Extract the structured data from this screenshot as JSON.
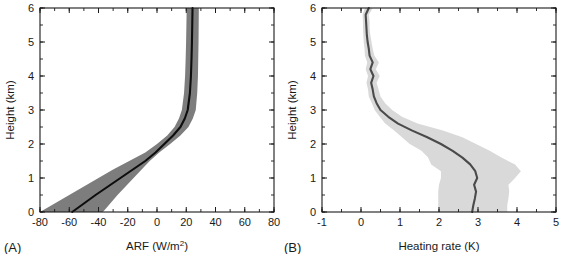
{
  "figure": {
    "background": "#ffffff",
    "width": 567,
    "height": 254
  },
  "panels": {
    "a": {
      "label": "(A)",
      "xlabel_main": "ARF (W/m",
      "xlabel_sup": "2",
      "xlabel_tail": ")",
      "xlabel_full": "ARF (W/m2)",
      "ylabel": "Height (km)",
      "band_color": "#7d7d7d",
      "line_color": "#0d0d0d"
    },
    "b": {
      "label": "(B)",
      "xlabel_full": "Heating rate (K)",
      "ylabel": "Height (km)",
      "band_color": "#d9d9d9",
      "line_color": "#4a4a4a"
    }
  },
  "chart_data": [
    {
      "id": "panel-a",
      "type": "line",
      "title": "",
      "panel_label": "(A)",
      "xlabel": "ARF (W/m2)",
      "ylabel": "Height (km)",
      "xlim": [
        -80,
        80
      ],
      "ylim": [
        0,
        6
      ],
      "xticks": [
        -80,
        -60,
        -40,
        -20,
        0,
        20,
        40,
        60,
        80
      ],
      "xticklabels": [
        "-80",
        "-60",
        "-40",
        "-20",
        "0",
        "20",
        "40",
        "60",
        "80"
      ],
      "yticks": [
        0,
        1,
        2,
        3,
        4,
        5,
        6
      ],
      "yticklabels": [
        "0",
        "1",
        "2",
        "3",
        "4",
        "5",
        "6"
      ],
      "x_minor_interval": 10,
      "y_minor_interval": 0.5,
      "grid": false,
      "legend": null,
      "orientation": "vertical-profile",
      "series": [
        {
          "name": "ARF mean",
          "style": "solid-black",
          "height_km": [
            0.0,
            0.25,
            0.5,
            0.75,
            1.0,
            1.25,
            1.5,
            1.75,
            2.0,
            2.25,
            2.5,
            2.75,
            3.0,
            3.5,
            4.0,
            4.5,
            5.0,
            5.5,
            6.0
          ],
          "values": [
            -58.0,
            -50.0,
            -42.0,
            -33.5,
            -25.0,
            -16.5,
            -8.0,
            -1.0,
            5.0,
            11.0,
            16.0,
            19.0,
            21.0,
            22.5,
            23.2,
            23.6,
            23.9,
            24.1,
            24.3
          ]
        },
        {
          "name": "ARF range (shaded band)",
          "style": "shaded",
          "height_km": [
            0.0,
            0.25,
            0.5,
            0.75,
            1.0,
            1.25,
            1.5,
            1.75,
            2.0,
            2.25,
            2.5,
            2.75,
            3.0,
            3.5,
            4.0,
            4.5,
            5.0,
            5.5,
            6.0
          ],
          "lower": [
            -80.0,
            -70.0,
            -60.0,
            -50.0,
            -40.0,
            -30.0,
            -19.0,
            -8.0,
            0.0,
            7.0,
            12.0,
            15.0,
            17.0,
            18.5,
            19.2,
            19.6,
            19.9,
            20.1,
            20.3
          ],
          "upper": [
            -37.0,
            -32.0,
            -27.0,
            -21.5,
            -16.0,
            -10.5,
            -5.0,
            1.5,
            9.0,
            16.0,
            21.5,
            24.5,
            26.5,
            27.5,
            28.0,
            28.2,
            28.4,
            28.5,
            28.6
          ]
        }
      ]
    },
    {
      "id": "panel-b",
      "type": "line",
      "title": "",
      "panel_label": "(B)",
      "xlabel": "Heating rate (K)",
      "ylabel": "Height (km)",
      "xlim": [
        -1,
        5
      ],
      "ylim": [
        0,
        6
      ],
      "xticks": [
        -1,
        0,
        1,
        2,
        3,
        4,
        5
      ],
      "xticklabels": [
        "-1",
        "0",
        "1",
        "2",
        "3",
        "4",
        "5"
      ],
      "yticks": [
        0,
        1,
        2,
        3,
        4,
        5,
        6
      ],
      "yticklabels": [
        "0",
        "1",
        "2",
        "3",
        "4",
        "5",
        "6"
      ],
      "x_minor_interval": 0.5,
      "y_minor_interval": 0.5,
      "grid": false,
      "legend": null,
      "orientation": "vertical-profile",
      "series": [
        {
          "name": "Heating rate mean",
          "style": "solid-gray",
          "height_km": [
            0.0,
            0.2,
            0.4,
            0.6,
            0.8,
            1.0,
            1.2,
            1.4,
            1.6,
            1.8,
            2.0,
            2.2,
            2.4,
            2.6,
            2.8,
            3.0,
            3.2,
            3.4,
            3.6,
            3.8,
            4.0,
            4.2,
            4.4,
            4.6,
            4.8,
            5.0,
            5.2,
            5.4,
            5.6,
            5.8,
            6.0
          ],
          "values": [
            2.85,
            2.88,
            2.92,
            2.95,
            2.9,
            2.98,
            2.93,
            2.8,
            2.6,
            2.35,
            2.05,
            1.7,
            1.3,
            0.95,
            0.7,
            0.5,
            0.4,
            0.33,
            0.3,
            0.26,
            0.32,
            0.24,
            0.3,
            0.22,
            0.2,
            0.17,
            0.15,
            0.14,
            0.13,
            0.12,
            0.2
          ]
        },
        {
          "name": "Heating rate range (shaded band)",
          "style": "shaded",
          "height_km": [
            0.0,
            0.2,
            0.4,
            0.6,
            0.8,
            1.0,
            1.2,
            1.4,
            1.6,
            1.8,
            2.0,
            2.2,
            2.4,
            2.6,
            2.8,
            3.0,
            3.2,
            3.4,
            3.6,
            3.8,
            4.0,
            4.2,
            4.4,
            4.6,
            4.8,
            5.0,
            5.2,
            5.4,
            5.6,
            5.8,
            6.0
          ],
          "lower": [
            1.98,
            1.98,
            1.98,
            1.98,
            2.0,
            2.05,
            2.05,
            1.8,
            1.72,
            1.55,
            1.25,
            1.05,
            0.85,
            0.62,
            0.48,
            0.35,
            0.28,
            0.2,
            0.18,
            0.14,
            0.18,
            0.12,
            0.16,
            0.1,
            0.09,
            0.07,
            0.06,
            0.05,
            0.05,
            0.04,
            0.1
          ],
          "upper": [
            3.75,
            3.75,
            3.78,
            3.8,
            3.78,
            3.95,
            4.1,
            3.95,
            3.6,
            3.3,
            2.95,
            2.6,
            2.1,
            1.45,
            1.05,
            0.8,
            0.62,
            0.5,
            0.45,
            0.4,
            0.48,
            0.38,
            0.46,
            0.34,
            0.3,
            0.27,
            0.24,
            0.22,
            0.22,
            0.2,
            0.3
          ]
        }
      ]
    }
  ]
}
